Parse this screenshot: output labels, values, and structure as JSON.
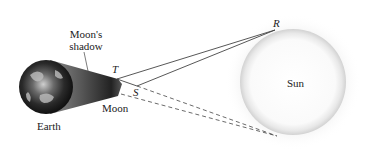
{
  "diagram": {
    "labels": {
      "moons_shadow_line1": "Moon's",
      "moons_shadow_line2": "shadow",
      "earth": "Earth",
      "moon": "Moon",
      "sun": "Sun",
      "point_t": "T",
      "point_s": "S",
      "point_r": "R"
    },
    "colors": {
      "line": "#444444",
      "sun_fill": "#ffffff",
      "sun_glow": "#d9d9d9",
      "shadow": "#3a3a3a",
      "earth_dark": "#1e1e1e"
    }
  }
}
